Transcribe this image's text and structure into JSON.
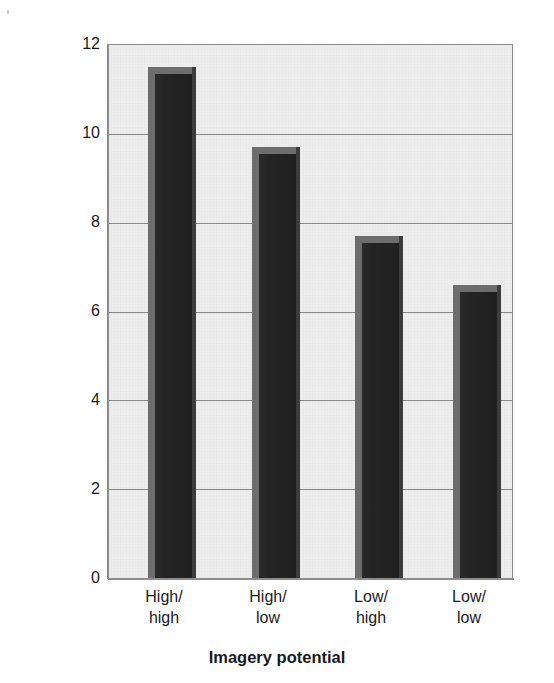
{
  "chart_data": {
    "type": "bar",
    "title": "",
    "xlabel": "Imagery potential",
    "ylabel": "Average number of pairs recalled",
    "categories": [
      "High/\nhigh",
      "High/\nlow",
      "Low/\nhigh",
      "Low/\nlow"
    ],
    "category_lines": [
      [
        "High/",
        "high"
      ],
      [
        "High/",
        "low"
      ],
      [
        "Low/",
        "high"
      ],
      [
        "Low/",
        "low"
      ]
    ],
    "values": [
      11.5,
      9.7,
      7.7,
      6.6
    ],
    "ylim": [
      0,
      12
    ],
    "yticks": [
      0,
      2,
      4,
      6,
      8,
      10,
      12
    ],
    "ytick_labels": [
      "0",
      "2",
      "4",
      "6",
      "8",
      "10",
      "12"
    ],
    "grid": true,
    "grid_axis": "y",
    "legend": "none",
    "bar_style": "3d-block",
    "colors": {
      "bar_face": "#242424",
      "bar_edge_highlight": "#6d6d6d",
      "bar_edge_shadow": "#3c3c3c",
      "plot_background": "#ededed",
      "gridline": "#878787",
      "axis": "#8c8c8c",
      "text": "#1a1a1a",
      "page_background": "#ffffff"
    }
  }
}
